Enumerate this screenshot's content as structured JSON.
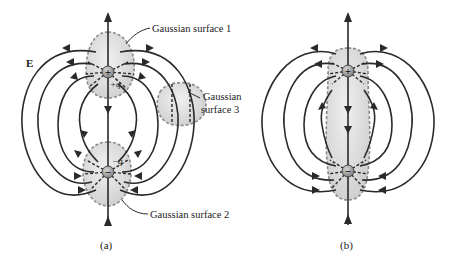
{
  "figure": {
    "colors": {
      "line": "#2a2a2a",
      "surface_fill": "#dcdcdc",
      "surface_border": "#8a8a8a",
      "charge_fill": "#9a9a9a"
    },
    "panel_a": {
      "caption": "(a)",
      "field_label": "E",
      "positive_charge": {
        "symbol": "+",
        "label": "+q"
      },
      "negative_charge": {
        "symbol": "−",
        "label": "−q"
      },
      "surfaces": [
        {
          "id": 1,
          "label": "Gaussian surface 1",
          "encloses": "+q"
        },
        {
          "id": 2,
          "label": "Gaussian surface 2",
          "encloses": "−q"
        },
        {
          "id": 3,
          "label_line1": "Gaussian",
          "label_line2": "surface 3",
          "encloses": "none"
        }
      ]
    },
    "panel_b": {
      "caption": "(b)",
      "positive_charge": {
        "symbol": "+"
      },
      "negative_charge": {
        "symbol": "−"
      },
      "surface": {
        "encloses": "+q and −q"
      }
    }
  }
}
